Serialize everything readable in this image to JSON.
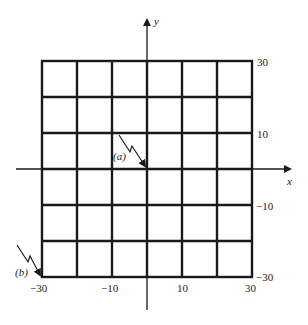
{
  "diagram": {
    "axes": {
      "x_label": "x",
      "y_label": "y"
    },
    "grid": {
      "rows": 6,
      "cols": 6,
      "x_range": [
        -30,
        30
      ],
      "y_range": [
        -30,
        30
      ]
    },
    "x_ticks": [
      {
        "value": -30,
        "label": "−30"
      },
      {
        "value": -10,
        "label": "−10"
      },
      {
        "value": 10,
        "label": "10"
      },
      {
        "value": 30,
        "label": "30"
      }
    ],
    "y_ticks": [
      {
        "value": 30,
        "label": "30"
      },
      {
        "value": 10,
        "label": "10"
      },
      {
        "value": -10,
        "label": "−10"
      },
      {
        "value": -30,
        "label": "−30"
      }
    ],
    "markers": [
      {
        "id": "a",
        "label": "(a)",
        "points_to": [
          0,
          0
        ]
      },
      {
        "id": "b",
        "label": "(b)",
        "points_to": [
          -30,
          -30
        ]
      }
    ],
    "colors": {
      "line": "#1a1a1a",
      "background": "#ffffff"
    }
  }
}
